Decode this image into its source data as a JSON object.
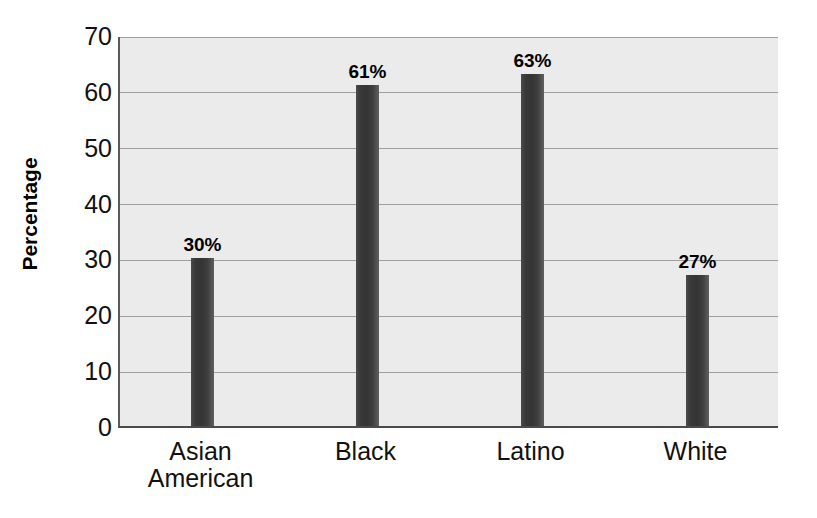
{
  "chart_data": {
    "type": "bar",
    "title": "",
    "subtitle": "",
    "xlabel": "",
    "ylabel": "Percentage",
    "categories": [
      "Asian American",
      "Black",
      "Latino",
      "White"
    ],
    "category_lines": [
      [
        "Asian",
        "American"
      ],
      [
        "Black"
      ],
      [
        "Latino"
      ],
      [
        "White"
      ]
    ],
    "values": [
      30,
      61,
      63,
      27
    ],
    "value_labels": [
      "30%",
      "61%",
      "63%",
      "27%"
    ],
    "ylim": [
      0,
      70
    ],
    "ytick_labels": [
      "0",
      "10",
      "20",
      "30",
      "40",
      "50",
      "60",
      "70"
    ],
    "ytick_values": [
      0,
      10,
      20,
      30,
      40,
      50,
      60,
      70
    ],
    "grid": "horizontal",
    "legend": "none",
    "legend_position": "none",
    "annotations": []
  },
  "style": {
    "plot_background": "#ebebeb",
    "gridline_color": "#9f9f9f",
    "bar_color_dark": "#343434",
    "bar_color_light": "#606060",
    "axis_color": "#4a4a4a",
    "text_color": "#111111",
    "page_background": "#ffffff"
  }
}
